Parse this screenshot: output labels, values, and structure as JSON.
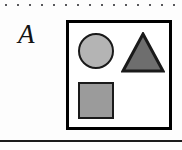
{
  "figure": {
    "panel_label": "A",
    "caption_rule_top": "dotted-rule",
    "caption_rule_bottom": "solid-rule"
  },
  "decorations": {
    "top_dotted_rule": {
      "name": "dotted-rule",
      "dot_count": 15,
      "dot_spacing_px": 12,
      "dot_size_px": 2,
      "color": "#58585c",
      "y_px": 5
    },
    "bottom_rule": {
      "name": "horizontal-rule",
      "color": "#1c1c1c",
      "thickness_px": 2,
      "y_px": 140,
      "width_px": 182
    }
  },
  "shape_box": {
    "name": "shape-container",
    "border_color": "#000000",
    "border_width_px": 3,
    "fill": "#ffffff",
    "x_px": 66,
    "y_px": 20,
    "width_px": 106,
    "height_px": 110
  },
  "shapes": [
    {
      "id": "circle",
      "label": "circle",
      "fill": "#b4b4b4",
      "stroke": "#1a1a1a",
      "stroke_width_px": 2,
      "position": "top-left",
      "diameter_px": 36
    },
    {
      "id": "triangle",
      "label": "triangle",
      "fill": "#6e6e6e",
      "stroke": "#1a1a1a",
      "stroke_width_px": 3,
      "position": "top-right",
      "width_px": 44,
      "height_px": 41,
      "orientation": "point-up"
    },
    {
      "id": "square",
      "label": "square",
      "fill": "#9b9b9b",
      "stroke": "#1a1a1a",
      "stroke_width_px": 2,
      "position": "bottom-left",
      "width_px": 36,
      "height_px": 37
    }
  ],
  "palette": {
    "background": "#fdfdfd",
    "ink": "#131313",
    "circle_gray": "#b4b4b4",
    "triangle_gray": "#6e6e6e",
    "square_gray": "#9b9b9b",
    "rule_gray": "#58585c"
  }
}
